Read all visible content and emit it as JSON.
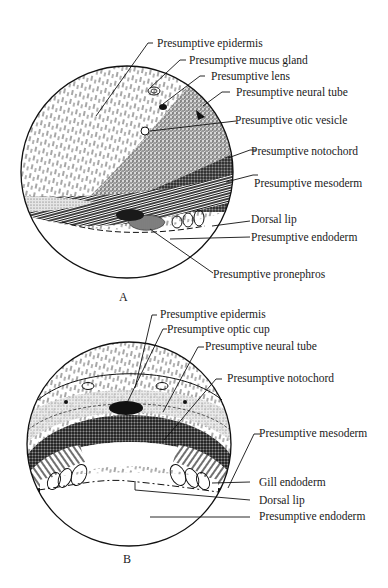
{
  "figure": {
    "panels": [
      {
        "id": "A",
        "letter": "A",
        "labels": [
          "Presumptive epidermis",
          "Presumptive mucus gland",
          "Presumptive lens",
          "Presumptive neural tube",
          "Presumptive otic vesicle",
          "Presumptive notochord",
          "Presumptive mesoderm",
          "Dorsal lip",
          "Presumptive endoderm",
          "Presumptive pronephros"
        ]
      },
      {
        "id": "B",
        "letter": "B",
        "labels": [
          "Presumptive epidermis",
          "Presumptive optic cup",
          "Presumptive neural tube",
          "Presumptive notochord",
          "Presumptive mesoderm",
          "Gill endoderm",
          "Dorsal lip",
          "Presumptive endoderm"
        ]
      }
    ],
    "colors": {
      "ink": "#1a1a1a",
      "background": "#ffffff"
    }
  }
}
